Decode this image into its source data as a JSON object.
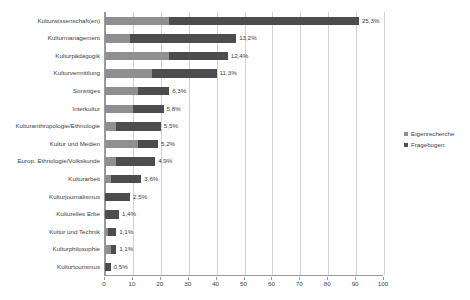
{
  "chart_data": {
    "type": "bar",
    "orientation": "horizontal",
    "stacked": true,
    "title": "",
    "xlabel": "",
    "ylabel": "",
    "xlim": [
      0,
      100
    ],
    "xticks": [
      0,
      10,
      20,
      30,
      40,
      50,
      60,
      70,
      80,
      90,
      100
    ],
    "grid": true,
    "legend_position": "right",
    "categories": [
      "Kulturwissenschaft(en)",
      "Kulturmanagement",
      "Kulturpädagogik",
      "Kulturvermittlung",
      "Sonstiges",
      "Interkultur",
      "Kulturanthropologie/Ethnologie",
      "Kultur und Medien",
      "Europ. Ethnologie/Volkskunde",
      "Kulturarbeit",
      "Kulturjournalismus",
      "Kulturelles Erbe",
      "Kultur und Technik",
      "Kulturphilosophie",
      "Kulturtourismus"
    ],
    "series": [
      {
        "name": "Eigenrecherche",
        "color": "#8f8f8f",
        "values": [
          23,
          9,
          23,
          17,
          12,
          10,
          4,
          12,
          4,
          2,
          0,
          0,
          1,
          2,
          0
        ]
      },
      {
        "name": "Fragebogen",
        "color": "#4d4d4d",
        "values": [
          68,
          38,
          21,
          23,
          11,
          11,
          16,
          7,
          14,
          11,
          9,
          5,
          3,
          2,
          2
        ]
      }
    ],
    "totals": [
      91,
      47,
      44,
      40,
      23,
      21,
      20,
      19,
      18,
      13,
      9,
      5,
      4,
      4,
      2
    ],
    "data_labels": [
      "25,3%",
      "13,2%",
      "12,4%",
      "11,3%",
      "6,3%",
      "5,8%",
      "5,5%",
      "5,2%",
      "4,9%",
      "3,6%",
      "2,5%",
      "1,4%",
      "1,1%",
      "1,1%",
      "0,5%"
    ]
  },
  "legend": {
    "items": [
      {
        "label": "Eigenrecherche"
      },
      {
        "label": "Fragebogen"
      }
    ]
  },
  "axis": {
    "tick_labels": [
      "0",
      "10",
      "20",
      "30",
      "40",
      "50",
      "60",
      "70",
      "80",
      "90",
      "100"
    ]
  }
}
